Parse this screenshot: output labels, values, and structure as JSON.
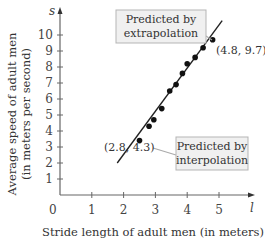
{
  "chart_data": {
    "type": "scatter",
    "title": "",
    "xlabel": "Stride length of adult men (in meters)",
    "ylabel_line1": "Average speed of adult men",
    "ylabel_line2": "(in meters per second)",
    "x_axis_symbol": "l",
    "y_axis_symbol": "s",
    "origin_label": "0",
    "x_ticks": [
      1,
      2,
      3,
      4,
      5
    ],
    "y_ticks": [
      1,
      2,
      3,
      4,
      5,
      6,
      7,
      8,
      9,
      10
    ],
    "xlim": [
      0,
      5.5
    ],
    "ylim": [
      0,
      10.8
    ],
    "grid": false,
    "points": [
      {
        "x": 2.5,
        "y": 3.4
      },
      {
        "x": 2.8,
        "y": 4.3
      },
      {
        "x": 2.95,
        "y": 4.7
      },
      {
        "x": 3.2,
        "y": 5.4
      },
      {
        "x": 3.45,
        "y": 6.5
      },
      {
        "x": 3.65,
        "y": 6.9
      },
      {
        "x": 3.85,
        "y": 7.6
      },
      {
        "x": 4.0,
        "y": 8.2
      },
      {
        "x": 4.25,
        "y": 8.6
      },
      {
        "x": 4.5,
        "y": 9.2
      },
      {
        "x": 4.8,
        "y": 9.7
      }
    ],
    "regression_line": {
      "x1": 1.8,
      "y1": 2.0,
      "x2": 5.1,
      "y2": 10.9
    },
    "annotations": [
      {
        "text": "(2.8, 4.3)",
        "x": 2.8,
        "y": 4.3
      },
      {
        "text": "(4.8, 9.7)",
        "x": 4.8,
        "y": 9.7
      }
    ],
    "callouts": [
      {
        "line1": "Predicted by",
        "line2": "extrapolation",
        "target": "(4.8, 9.7)"
      },
      {
        "line1": "Predicted by",
        "line2": "interpolation",
        "target": "(2.8, 4.3)"
      }
    ]
  },
  "colors": {
    "axis": "#666666",
    "line": "#222222",
    "point": "#111111",
    "callout_fill": "#f0f0f0",
    "callout_border": "#b5b5b5",
    "leader": "#aaaaaa"
  }
}
